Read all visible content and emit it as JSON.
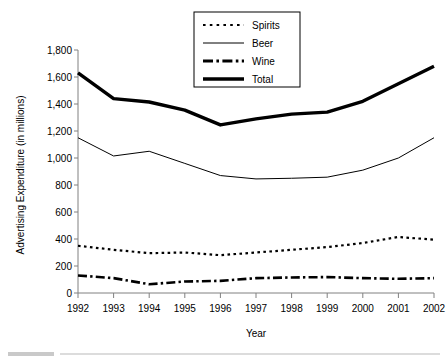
{
  "chart_data": {
    "type": "line",
    "title": "",
    "xlabel": "Year",
    "ylabel": "Advertising Expenditure (in millions)",
    "categories": [
      "1992",
      "1993",
      "1994",
      "1995",
      "1996",
      "1997",
      "1998",
      "1999",
      "2000",
      "2001",
      "2002"
    ],
    "x": [
      1992,
      1993,
      1994,
      1995,
      1996,
      1997,
      1998,
      1999,
      2000,
      2001,
      2002
    ],
    "xlim": [
      1992,
      2002
    ],
    "ylim": [
      0,
      1800
    ],
    "yticks": [
      "0",
      "200",
      "400",
      "600",
      "800",
      "1,000",
      "1,200",
      "1,400",
      "1,600",
      "1,800"
    ],
    "ytick_values": [
      0,
      200,
      400,
      600,
      800,
      1000,
      1200,
      1400,
      1600,
      1800
    ],
    "grid": false,
    "legend_position": "top-center",
    "series": [
      {
        "name": "Spirits",
        "style": "dotted",
        "color": "#000000",
        "values": [
          350,
          320,
          295,
          300,
          280,
          300,
          320,
          340,
          370,
          415,
          395
        ]
      },
      {
        "name": "Beer",
        "style": "solid-thin",
        "color": "#000000",
        "values": [
          1150,
          1015,
          1050,
          960,
          870,
          845,
          850,
          858,
          910,
          1000,
          1150
        ]
      },
      {
        "name": "Wine",
        "style": "dash-dot",
        "color": "#000000",
        "values": [
          130,
          110,
          65,
          85,
          90,
          110,
          115,
          118,
          110,
          105,
          110
        ]
      },
      {
        "name": "Total",
        "style": "solid-thick",
        "color": "#000000",
        "values": [
          1630,
          1440,
          1415,
          1355,
          1245,
          1290,
          1325,
          1340,
          1420,
          1550,
          1680
        ]
      }
    ]
  },
  "legend": {
    "items": [
      {
        "label": "Spirits",
        "sample": "dotted-line-sample"
      },
      {
        "label": "Beer",
        "sample": "thin-solid-line-sample"
      },
      {
        "label": "Wine",
        "sample": "dash-dot-line-sample"
      },
      {
        "label": "Total",
        "sample": "thick-solid-line-sample"
      }
    ]
  },
  "axes": {
    "y_title": "Advertising Expenditure (in millions)",
    "x_title": "Year"
  }
}
